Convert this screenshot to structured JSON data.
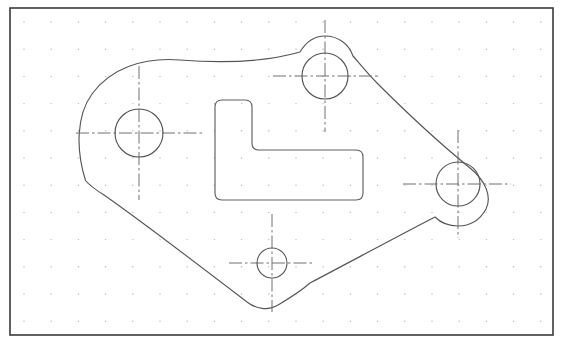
{
  "document": {
    "title": "CAD Technical Drawing - Gasket Plate",
    "canvas": {
      "width": 565,
      "height": 348,
      "background": "#ffffff"
    }
  },
  "colors": {
    "background": "#ffffff",
    "frame_stroke": "#3a3a3a",
    "outline_stroke": "#555555",
    "hole_stroke": "#555555",
    "cutout_stroke": "#606060",
    "centerline_stroke": "#707070",
    "grid_dot": "#b9b9b9"
  },
  "frame": {
    "label": "drawing-border",
    "x": 10,
    "y": 8,
    "width": 543,
    "height": 327,
    "stroke_width": 1.6
  },
  "grid": {
    "label": "dot-grid",
    "spacing": 27.2,
    "origin_x": 24,
    "origin_y": 22,
    "dot_radius": 0.7,
    "visible": true
  },
  "part": {
    "name": "gasket-plate-outline",
    "stroke_width": 1.15,
    "path": "M 85.5 180.5 C 76 150 76 116 92 94 C 110 69 142 57 180 60 C 230 64 272 60 300 52 C 306 42 314 36 325 36 C 338 36 349 44 353 56 C 360 64 368 74 378 84 C 404 110 438 142 470 168 C 486 181 492 197 486 209 C 480 220 470 226 458 226 C 449 226 441 223 435 217 C 400 235 350 262 310 283 C 300 292 288 299 278 305 C 268 311 256 309 247 302 C 200 266 140 220 104 195 C 96 190 90 186 85.5 180.5 Z"
  },
  "cutout": {
    "name": "l-shaped-cutout",
    "stroke_width": 1.15,
    "path": "M 222 100 L 245 100 Q 252 100 252 107 L 252 143 Q 252 150 259 150 L 356 150 Q 363 150 363 157 L 363 193 Q 363 200 356 200 L 222 200 Q 215 200 215 193 L 215 107 Q 215 100 222 100 Z"
  },
  "holes": [
    {
      "name": "hole-left",
      "cx": 139,
      "cy": 133,
      "r": 24,
      "centerline_h_x1": 76,
      "centerline_h_x2": 203,
      "centerline_v_y1": 66,
      "centerline_v_y2": 200
    },
    {
      "name": "hole-top",
      "cx": 325,
      "cy": 76,
      "r": 23,
      "centerline_h_x1": 273,
      "centerline_h_x2": 378,
      "centerline_v_y1": 20,
      "centerline_v_y2": 132
    },
    {
      "name": "hole-right",
      "cx": 458,
      "cy": 184,
      "r": 22,
      "centerline_h_x1": 403,
      "centerline_h_x2": 511,
      "centerline_v_y1": 130,
      "centerline_v_y2": 238
    },
    {
      "name": "hole-bottom",
      "cx": 272,
      "cy": 263,
      "r": 15,
      "centerline_h_x1": 229,
      "centerline_h_x2": 315,
      "centerline_v_y1": 214,
      "centerline_v_y2": 312
    }
  ],
  "centerline": {
    "stroke_width": 1.0,
    "dash_pattern": "13 3 2.5 3"
  }
}
